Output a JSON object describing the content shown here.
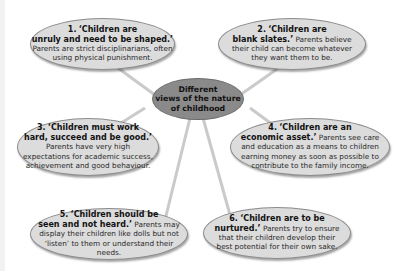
{
  "diagram": {
    "center": {
      "line1": "Different",
      "line2": "views of the nature",
      "line3": "of childhood"
    },
    "views": [
      {
        "number": "1.",
        "title_line1": "‘Children are",
        "title_line2": "unruly and need to be shaped.’",
        "description": "Parents are strict disciplinarians, often using physical punishment."
      },
      {
        "number": "2.",
        "title_line1": "‘Children are",
        "title_line2": "blank slates.’",
        "description": "Parents believe their child can become whatever they want them to be."
      },
      {
        "number": "3.",
        "title_line1": "‘Children must work",
        "title_line2": "hard, succeed and be good.’",
        "description": "Parents have very high expectations for academic success, achievement and good behaviour."
      },
      {
        "number": "4.",
        "title_line1": "‘Children are an",
        "title_line2": "economic asset.’",
        "description": "Parents see care and education as a means to children earning money as soon as possible to contribute to the family income."
      },
      {
        "number": "5.",
        "title_line1": "‘Children should be",
        "title_line2": "seen and not heard.’",
        "description": "Parents may display their children like dolls but not ‘listen’ to them or understand their needs."
      },
      {
        "number": "6.",
        "title_line1": "‘Children are to be",
        "title_line2": "nurtured.’",
        "description": "Parents try to ensure that their children develop their best potential for their own sake."
      }
    ],
    "colors": {
      "bubble_fill": "#dcdcdc",
      "center_fill": "#8a8a8a",
      "connector": "#c8c8c8"
    }
  }
}
